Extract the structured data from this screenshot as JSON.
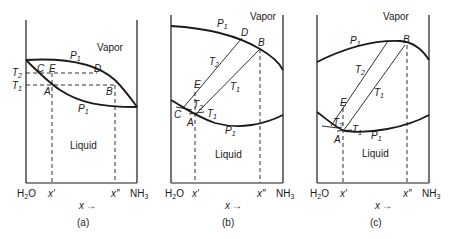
{
  "figure": {
    "panels": [
      {
        "id": "a",
        "caption": "(a)",
        "region_vapor": "Vapor",
        "region_liquid": "Liquid",
        "left_component": {
          "main": "H",
          "sub": "2",
          "rest": "O"
        },
        "right_component": {
          "main": "NH",
          "sub": "3"
        },
        "x_axis_label": "x",
        "x_arrow": "→",
        "x_prime": "x′",
        "x_double_prime": "x″",
        "pressure_upper": {
          "main": "P",
          "sub": "1"
        },
        "pressure_lower": {
          "main": "P",
          "sub": "1"
        },
        "temp_T2": {
          "main": "T",
          "sub": "2"
        },
        "temp_T1": {
          "main": "T",
          "sub": "1"
        },
        "points": {
          "A": "A",
          "B": "B",
          "C": "C",
          "D": "D",
          "E": "E"
        }
      },
      {
        "id": "b",
        "caption": "(b)",
        "region_vapor": "Vapor",
        "region_liquid": "Liquid",
        "left_component": {
          "main": "H",
          "sub": "2",
          "rest": "O"
        },
        "right_component": {
          "main": "NH",
          "sub": "3"
        },
        "x_axis_label": "x",
        "x_arrow": "→",
        "x_prime": "x′",
        "x_double_prime": "x″",
        "pressure_upper": {
          "main": "P",
          "sub": "1"
        },
        "pressure_lower": {
          "main": "P",
          "sub": "1"
        },
        "temp_T2_line": {
          "main": "T",
          "sub": "2"
        },
        "temp_T1_line": {
          "main": "T",
          "sub": "1"
        },
        "temp_T2_small": {
          "main": "T",
          "sub": "2"
        },
        "temp_T1_small": {
          "main": "T",
          "sub": "1"
        },
        "points": {
          "A": "A",
          "B": "B",
          "C": "C",
          "D": "D",
          "E": "E"
        }
      },
      {
        "id": "c",
        "caption": "(c)",
        "region_vapor": "Vapor",
        "region_liquid": "Liquid",
        "left_component": {
          "main": "H",
          "sub": "2",
          "rest": "O"
        },
        "right_component": {
          "main": "NH",
          "sub": "3"
        },
        "x_axis_label": "x",
        "x_arrow": "→",
        "x_prime": "x′",
        "x_double_prime": "x″",
        "pressure_upper": {
          "main": "P",
          "sub": "1"
        },
        "pressure_lower": {
          "main": "P",
          "sub": "1"
        },
        "temp_T2_line": {
          "main": "T",
          "sub": "2"
        },
        "temp_T1_line": {
          "main": "T",
          "sub": "1"
        },
        "temp_T2_small": {
          "main": "T",
          "sub": "2"
        },
        "temp_T1_small": {
          "main": "T",
          "sub": "1"
        },
        "points": {
          "A": "A",
          "B": "B",
          "E": "E"
        }
      }
    ]
  }
}
